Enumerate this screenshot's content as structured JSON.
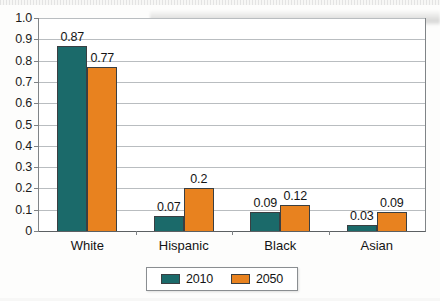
{
  "chart_data": {
    "type": "bar",
    "title": "",
    "subtitle": "",
    "xlabel": "",
    "ylabel": "",
    "categories": [
      "White",
      "Hispanic",
      "Black",
      "Asian"
    ],
    "series": [
      {
        "name": "2010",
        "color": "#1b6a6a",
        "values": [
          0.87,
          0.07,
          0.09,
          0.03
        ],
        "labels": [
          "0.87",
          "0.07",
          "0.09",
          "0.03"
        ]
      },
      {
        "name": "2050",
        "color": "#e8821f",
        "values": [
          0.77,
          0.2,
          0.12,
          0.09
        ],
        "labels": [
          "0.77",
          "0.2",
          "0.12",
          "0.09"
        ]
      }
    ],
    "ylim": [
      0,
      1.0
    ],
    "ytick_values": [
      1.0,
      0.9,
      0.8,
      0.7,
      0.6,
      0.5,
      0.4,
      0.3,
      0.2,
      0.1,
      0
    ],
    "ytick_labels": [
      "1.0",
      "0.9",
      "0.8",
      "0.7",
      "0.6",
      "0.5",
      "0.4",
      "0.3",
      "0.2",
      "0.1",
      "0"
    ],
    "grid": true,
    "grid_axis": "y",
    "legend_position": "bottom",
    "legend_entries": [
      "2010",
      "2050"
    ],
    "data_labels": true
  }
}
